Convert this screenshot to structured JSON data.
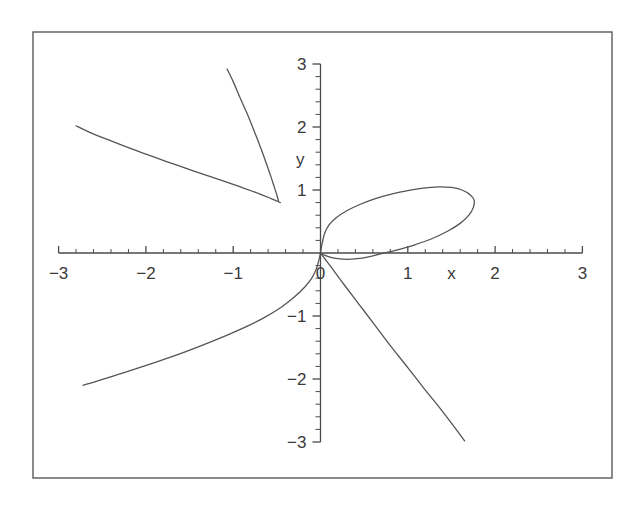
{
  "figure": {
    "background_color": "#ffffff",
    "frame": {
      "name": "plot-frame",
      "stroke_color": "#5a5a5a",
      "x": 33,
      "y": 32,
      "width": 579,
      "height": 446
    },
    "curve_color": "#555555",
    "axis_color": "#4a4a4a"
  },
  "chart_data": {
    "type": "line",
    "title": "",
    "xlabel": "x",
    "ylabel": "y",
    "xlim": [
      -3,
      3
    ],
    "ylim": [
      -3,
      3
    ],
    "grid": false,
    "legend": null,
    "x_ticks": [
      -3,
      -2,
      -1,
      0,
      1,
      2,
      3
    ],
    "y_ticks": [
      -3,
      -2,
      -1,
      1,
      2,
      3
    ],
    "x_tick_labels": [
      "-3",
      "-2",
      "-1",
      "0",
      "1",
      "2",
      "3"
    ],
    "y_tick_labels": [
      "-3",
      "-2",
      "-1",
      "1",
      "2",
      "3"
    ],
    "minor_ticks_per_interval": 5,
    "axis_position": "zero",
    "series": [
      {
        "name": "loop-branch",
        "description": "closed loop from origin through first quadrant back to origin",
        "points": [
          [
            0.0,
            0.0
          ],
          [
            0.02,
            0.16
          ],
          [
            0.05,
            0.32
          ],
          [
            0.1,
            0.45
          ],
          [
            0.18,
            0.56
          ],
          [
            0.3,
            0.67
          ],
          [
            0.45,
            0.77
          ],
          [
            0.62,
            0.86
          ],
          [
            0.8,
            0.93
          ],
          [
            1.0,
            0.99
          ],
          [
            1.18,
            1.03
          ],
          [
            1.35,
            1.05
          ],
          [
            1.5,
            1.04
          ],
          [
            1.62,
            1.0
          ],
          [
            1.71,
            0.93
          ],
          [
            1.76,
            0.84
          ],
          [
            1.75,
            0.72
          ],
          [
            1.7,
            0.6
          ],
          [
            1.6,
            0.47
          ],
          [
            1.46,
            0.35
          ],
          [
            1.28,
            0.23
          ],
          [
            1.08,
            0.13
          ],
          [
            0.88,
            0.05
          ],
          [
            0.7,
            -0.01
          ],
          [
            0.55,
            -0.06
          ],
          [
            0.42,
            -0.09
          ],
          [
            0.3,
            -0.1
          ],
          [
            0.2,
            -0.09
          ],
          [
            0.12,
            -0.07
          ],
          [
            0.06,
            -0.04
          ],
          [
            0.02,
            -0.02
          ],
          [
            0.0,
            0.0
          ]
        ]
      },
      {
        "name": "lower-left-branch",
        "description": "branch from origin going down and left toward asymptote",
        "points": [
          [
            0.0,
            0.0
          ],
          [
            -0.02,
            -0.12
          ],
          [
            -0.05,
            -0.26
          ],
          [
            -0.1,
            -0.4
          ],
          [
            -0.18,
            -0.54
          ],
          [
            -0.3,
            -0.7
          ],
          [
            -0.45,
            -0.86
          ],
          [
            -0.65,
            -1.03
          ],
          [
            -0.9,
            -1.2
          ],
          [
            -1.2,
            -1.38
          ],
          [
            -1.55,
            -1.57
          ],
          [
            -1.9,
            -1.74
          ],
          [
            -2.25,
            -1.9
          ],
          [
            -2.55,
            -2.03
          ],
          [
            -2.72,
            -2.1
          ]
        ]
      },
      {
        "name": "lower-right-branch",
        "description": "nearly straight branch from origin down to the right",
        "points": [
          [
            0.0,
            0.0
          ],
          [
            0.12,
            -0.22
          ],
          [
            0.28,
            -0.52
          ],
          [
            0.45,
            -0.83
          ],
          [
            0.62,
            -1.14
          ],
          [
            0.8,
            -1.47
          ],
          [
            1.0,
            -1.82
          ],
          [
            1.18,
            -2.14
          ],
          [
            1.35,
            -2.43
          ],
          [
            1.5,
            -2.7
          ],
          [
            1.65,
            -2.98
          ]
        ]
      },
      {
        "name": "upper-left-cusp-upper-arm",
        "description": "arm of upper-left V rising steeply to top",
        "points": [
          [
            -0.48,
            0.82
          ],
          [
            -0.5,
            0.92
          ],
          [
            -0.53,
            1.05
          ],
          [
            -0.57,
            1.22
          ],
          [
            -0.62,
            1.42
          ],
          [
            -0.68,
            1.65
          ],
          [
            -0.75,
            1.9
          ],
          [
            -0.83,
            2.18
          ],
          [
            -0.92,
            2.46
          ],
          [
            -1.0,
            2.72
          ],
          [
            -1.07,
            2.92
          ]
        ]
      },
      {
        "name": "upper-left-cusp-lower-arm",
        "description": "arm of upper-left V extending to the left edge",
        "points": [
          [
            -0.46,
            0.8
          ],
          [
            -0.56,
            0.86
          ],
          [
            -0.7,
            0.94
          ],
          [
            -0.9,
            1.04
          ],
          [
            -1.15,
            1.16
          ],
          [
            -1.45,
            1.3
          ],
          [
            -1.78,
            1.46
          ],
          [
            -2.1,
            1.62
          ],
          [
            -2.4,
            1.78
          ],
          [
            -2.65,
            1.92
          ],
          [
            -2.8,
            2.02
          ]
        ]
      }
    ]
  },
  "labels": {
    "x_axis_label": "x",
    "y_axis_label": "y"
  }
}
